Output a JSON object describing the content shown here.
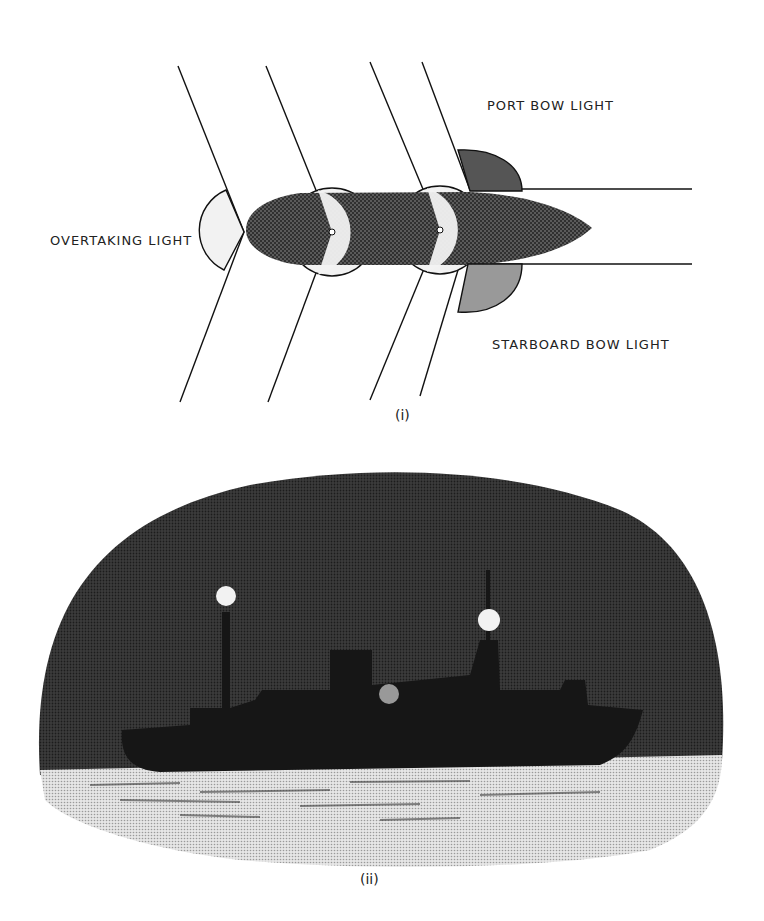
{
  "figure_i": {
    "caption": "(i)",
    "labels": {
      "port": "PORT BOW LIGHT",
      "overtaking": "OVERTAKING LIGHT",
      "starboard": "STARBOARD BOW LIGHT"
    }
  },
  "figure_ii": {
    "caption": "(ii)"
  },
  "colors": {
    "port_light": "#555555",
    "starboard_light": "#999999",
    "white_light": "#f0f0f0",
    "hull": "#3a3a3a",
    "night_sky": "#2e2e2e",
    "ship_silhouette": "#161616",
    "sea": "#c8c8c8"
  }
}
